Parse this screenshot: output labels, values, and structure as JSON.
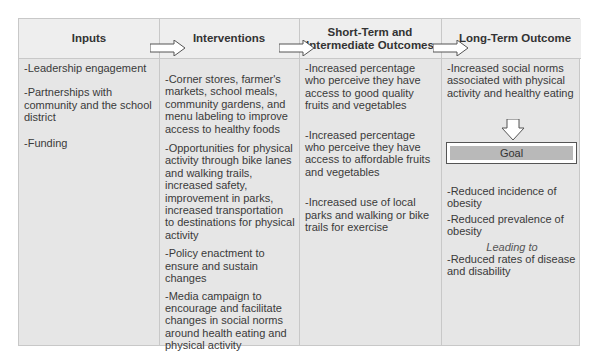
{
  "diagram": {
    "type": "logic-model",
    "columns": [
      {
        "header": "Inputs",
        "items": [
          "-Leadership engagement",
          "-Partnerships with community and the school district",
          "-Funding"
        ]
      },
      {
        "header": "Interventions",
        "items": [
          "-Corner stores, farmer's markets, school meals, community gardens, and menu labeling to improve access to healthy foods",
          "-Opportunities for physical activity through bike lanes and walking trails, increased safety, improvement in parks, increased transportation to destinations for physical activity",
          "-Policy enactment to ensure and sustain changes",
          "-Media campaign to encourage and facilitate changes in social norms around health eating and physical activity"
        ]
      },
      {
        "header": "Short-Term and Intermediate Outcomes",
        "items": [
          "-Increased percentage who perceive they have access to good quality fruits and vegetables",
          "-Increased percentage who perceive they have access to affordable fruits and vegetables",
          "-Increased use of local parks and walking or bike trails for exercise"
        ]
      },
      {
        "header": "Long-Term Outcome",
        "top_item": "-Increased social norms associated with physical activity and healthy eating",
        "goal_label": "Goal",
        "goal_items": [
          "-Reduced incidence of obesity",
          "-Reduced prevalence of obesity"
        ],
        "leading_to": "Leading to",
        "final_item": "-Reduced rates of disease and disability"
      }
    ],
    "colors": {
      "header_bg": "#eeeeee",
      "body_bg": "#e6e6e6",
      "border": "#c8c8c8",
      "goal_fill": "#b9b9b9"
    }
  }
}
